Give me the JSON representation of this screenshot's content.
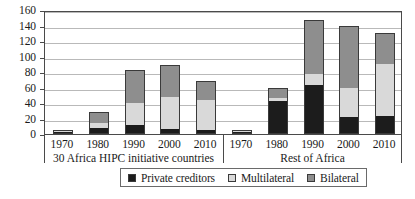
{
  "chart_data": {
    "type": "bar",
    "subtype": "stacked-bar-grouped",
    "title": "",
    "subtitle": "",
    "xlabel": "",
    "ylabel": "",
    "ylim": [
      0,
      160
    ],
    "yticks": [
      0,
      20,
      40,
      60,
      80,
      100,
      120,
      140,
      160
    ],
    "ytick_labels": [
      "0",
      "20",
      "40",
      "60",
      "80",
      "100",
      "120",
      "140",
      "160"
    ],
    "grid": true,
    "grid_axis": "y",
    "legend_position": "bottom-center",
    "legend_entries": [
      "Private creditors",
      "Multilateral",
      "Bilateral"
    ],
    "series_colors": {
      "Private creditors": "#1c1c1c",
      "Multilateral": "#d9d9d9",
      "Bilateral": "#8e8e8e"
    },
    "categories": [
      "1970",
      "1980",
      "1990",
      "2000",
      "2010"
    ],
    "groups": [
      {
        "label": "30 Africa HIPC initiative countries",
        "categories": [
          "1970",
          "1980",
          "1990",
          "2000",
          "2010"
        ],
        "series": [
          {
            "name": "Private creditors",
            "values": [
              2,
              8,
              12,
              7,
              5
            ]
          },
          {
            "name": "Multilateral",
            "values": [
              1,
              6,
              28,
              41,
              39
            ]
          },
          {
            "name": "Bilateral",
            "values": [
              1,
              14,
              42,
              41,
              24
            ]
          }
        ],
        "totals": [
          4,
          28,
          82,
          89,
          68
        ]
      },
      {
        "label": "Rest of Africa",
        "categories": [
          "1970",
          "1980",
          "1990",
          "2000",
          "2010"
        ],
        "series": [
          {
            "name": "Private creditors",
            "values": [
              2,
              42,
              63,
              22,
              23
            ]
          },
          {
            "name": "Multilateral",
            "values": [
              0.5,
              4,
              15,
              38,
              67
            ]
          },
          {
            "name": "Bilateral",
            "values": [
              0.5,
              14,
              69,
              79,
              41
            ]
          }
        ],
        "totals": [
          3,
          60,
          147,
          139,
          131
        ]
      }
    ]
  },
  "legend": {
    "items": [
      {
        "label": "Private creditors",
        "swatch": "#1c1c1c"
      },
      {
        "label": "Multilateral",
        "swatch": "#d9d9d9"
      },
      {
        "label": "Bilateral",
        "swatch": "#8e8e8e"
      }
    ]
  },
  "axis": {
    "y": {
      "labels": [
        "160",
        "140",
        "120",
        "100",
        "80",
        "60",
        "40",
        "20",
        "0"
      ]
    },
    "x": {
      "left_group": {
        "label": "30 Africa HIPC initiative countries",
        "ticks": [
          "1970",
          "1980",
          "1990",
          "2000",
          "2010"
        ]
      },
      "right_group": {
        "label": "Rest of Africa",
        "ticks": [
          "1970",
          "1980",
          "1990",
          "2000",
          "2010"
        ]
      }
    }
  }
}
